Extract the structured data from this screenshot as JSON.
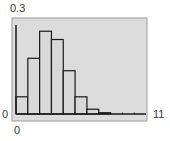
{
  "chart_data": {
    "type": "bar",
    "title": "",
    "xlabel": "",
    "ylabel": "",
    "categories": [
      "0-1",
      "1-2",
      "2-3",
      "3-4",
      "4-5",
      "5-6",
      "6-7",
      "7-8",
      "8-9",
      "9-10",
      "10-11"
    ],
    "bin_edges": [
      0,
      1,
      2,
      3,
      4,
      5,
      6,
      7,
      8,
      9,
      10,
      11
    ],
    "values": [
      0.054,
      0.175,
      0.26,
      0.234,
      0.136,
      0.054,
      0.015,
      0.004,
      0.001,
      0.001,
      0.0
    ],
    "xlim": [
      0,
      11
    ],
    "ylim": [
      0,
      0.3
    ],
    "grid": false,
    "legend": null,
    "tick_labels": {
      "x_min": "0",
      "x_max": "11",
      "y_min": "0",
      "y_max": "0.3"
    },
    "style": {
      "window_bg": "#dcdcdc",
      "frame": "#9a9a9a",
      "bar_fill": "#d8d8d8",
      "bar_edge": "#1a1a1a"
    }
  }
}
